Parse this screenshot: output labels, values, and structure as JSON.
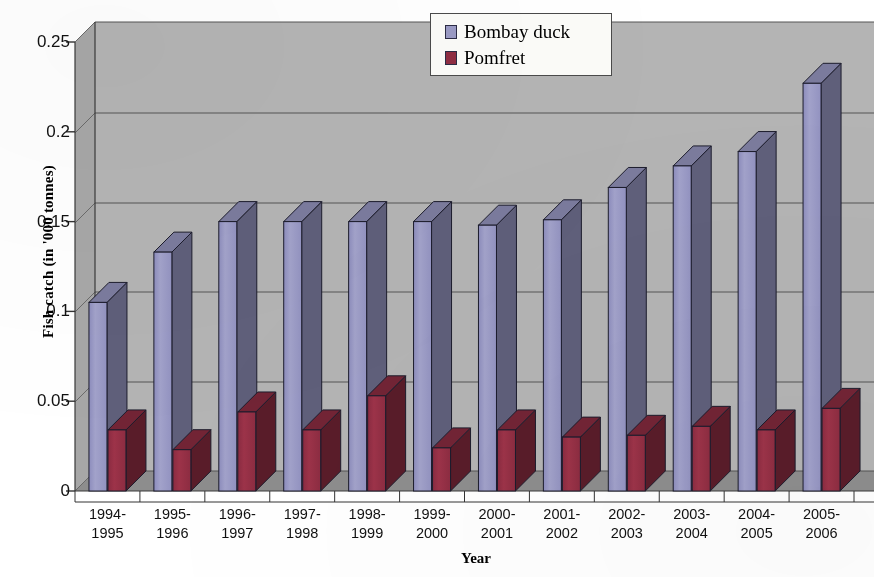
{
  "chart_data": {
    "type": "bar",
    "title": "",
    "xlabel": "Year",
    "ylabel": "Fish catch (in '000 tonnes)",
    "categories": [
      "1994-\n1995",
      "1995-\n1996",
      "1996-\n1997",
      "1997-\n1998",
      "1998-\n1999",
      "1999-\n2000",
      "2000-\n2001",
      "2001-\n2002",
      "2002-\n2003",
      "2003-\n2004",
      "2004-\n2005",
      "2005-\n2006"
    ],
    "category_lines": [
      [
        "1994-",
        "1995"
      ],
      [
        "1995-",
        "1996"
      ],
      [
        "1996-",
        "1997"
      ],
      [
        "1997-",
        "1998"
      ],
      [
        "1998-",
        "1999"
      ],
      [
        "1999-",
        "2000"
      ],
      [
        "2000-",
        "2001"
      ],
      [
        "2001-",
        "2002"
      ],
      [
        "2002-",
        "2003"
      ],
      [
        "2003-",
        "2004"
      ],
      [
        "2004-",
        "2005"
      ],
      [
        "2005-",
        "2006"
      ]
    ],
    "series": [
      {
        "name": "Bombay duck",
        "color": "#9a9ac4",
        "values": [
          0.105,
          0.133,
          0.15,
          0.15,
          0.15,
          0.15,
          0.148,
          0.151,
          0.169,
          0.181,
          0.189,
          0.227
        ]
      },
      {
        "name": "Pomfret",
        "color": "#8f2d42",
        "values": [
          0.034,
          0.023,
          0.044,
          0.034,
          0.053,
          0.024,
          0.034,
          0.03,
          0.031,
          0.036,
          0.034,
          0.046
        ]
      }
    ],
    "yticks": [
      0,
      0.05,
      0.1,
      0.15,
      0.2,
      0.25
    ],
    "ytick_labels": [
      "0",
      "0.05",
      "0.1",
      "0.15",
      "0.2",
      "0.25"
    ],
    "ylim": [
      0,
      0.25
    ],
    "grid": true,
    "legend_position": "top-center",
    "style": "3d-column",
    "plot_background": "#b3b3b3",
    "floor_color": "#8e8e8e",
    "legend_background": "#fbfbf8"
  },
  "legend": {
    "items": [
      {
        "label": "Bombay duck",
        "color": "#9a9ac4"
      },
      {
        "label": "Pomfret",
        "color": "#8f2d42"
      }
    ]
  },
  "axes": {
    "y_title": "Fish catch (in '000 tonnes)",
    "x_title": "Year"
  }
}
